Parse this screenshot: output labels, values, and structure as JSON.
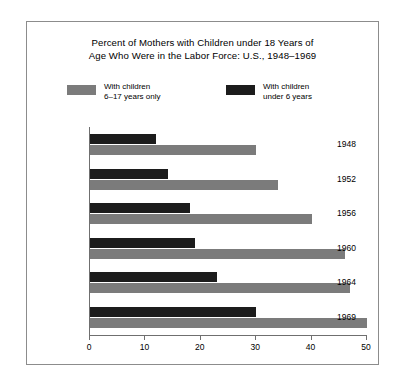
{
  "chart_data": {
    "type": "bar",
    "orientation": "horizontal",
    "title": "Percent of Mothers with Children under 18 Years of Age Who Were in the Labor Force: U.S., 1948–1969",
    "title_line1": "Percent of Mothers with Children under 18 Years of",
    "title_line2": "Age Who Were in the Labor Force: U.S., 1948–1969",
    "xlabel": "",
    "ylabel": "",
    "categories": [
      "1948",
      "1952",
      "1956",
      "1960",
      "1964",
      "1969"
    ],
    "series": [
      {
        "name": "With children under 6 years",
        "name_line1": "With children",
        "name_line2": "under 6 years",
        "color": "#1c1c1c",
        "values": [
          12,
          14,
          18,
          19,
          23,
          30
        ]
      },
      {
        "name": "With children 6–17 years only",
        "name_line1": "With children",
        "name_line2": "6–17 years only",
        "color": "#7b7b7b",
        "values": [
          30,
          34,
          40,
          46,
          47,
          50
        ]
      }
    ],
    "xlim": [
      0,
      50
    ],
    "xticks": [
      0,
      10,
      20,
      30,
      40,
      50
    ],
    "xtick_labels": [
      "0",
      "10",
      "20",
      "30",
      "40",
      "50"
    ],
    "grid": false,
    "legend_position": "top",
    "legend_order": [
      "With children 6–17 years only",
      "With children under 6 years"
    ]
  }
}
